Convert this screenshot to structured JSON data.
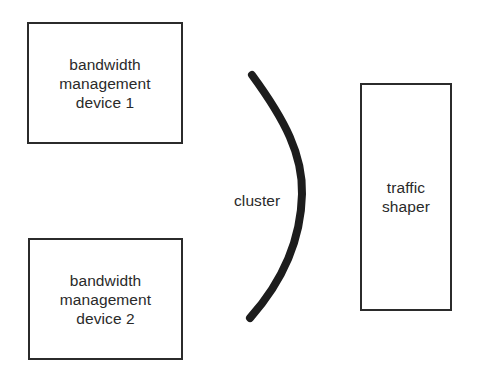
{
  "diagram": {
    "background_color": "#ffffff",
    "stroke_color": "#2b2b2b",
    "text_color": "#2a2a2a",
    "nodes": [
      {
        "id": "device-1",
        "label": "bandwidth\nmanagement\ndevice 1",
        "shape": "rectangle"
      },
      {
        "id": "device-2",
        "label": "bandwidth\nmanagement\ndevice 2",
        "shape": "rectangle"
      },
      {
        "id": "traffic-shaper",
        "label": "traffic\nshaper",
        "shape": "rectangle"
      }
    ],
    "annotations": [
      {
        "id": "cluster",
        "label": "cluster",
        "marker": "arc"
      }
    ]
  }
}
